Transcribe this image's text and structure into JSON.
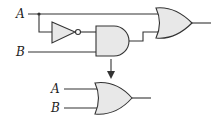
{
  "diagram": {
    "top_circuit": {
      "inputs": [
        {
          "label": "A"
        },
        {
          "label": "B"
        }
      ],
      "gates": [
        "NOT",
        "AND",
        "OR"
      ]
    },
    "arrow": "equivalent-to",
    "bottom_circuit": {
      "inputs": [
        {
          "label": "A"
        },
        {
          "label": "B"
        }
      ],
      "gates": [
        "OR"
      ]
    },
    "colors": {
      "stroke": "#333333",
      "gate_fill": "#e8e8e8"
    }
  }
}
